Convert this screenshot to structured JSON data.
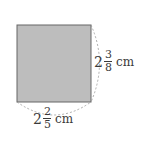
{
  "figure": {
    "shape": "rectangle",
    "fill_color": "#bdbdbd",
    "stroke_color": "#555555",
    "height_label": {
      "whole": "2",
      "numerator": "3",
      "denominator": "8",
      "unit": "cm"
    },
    "width_label": {
      "whole": "2",
      "numerator": "2",
      "denominator": "5",
      "unit": "cm"
    }
  }
}
